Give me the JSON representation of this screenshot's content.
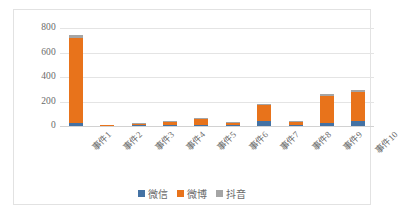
{
  "chart_data": {
    "type": "bar",
    "stacked": true,
    "title": "",
    "xlabel": "",
    "ylabel": "",
    "ylim": [
      0,
      800
    ],
    "yticks": [
      0,
      200,
      400,
      600,
      800
    ],
    "grid": true,
    "legend_position": "bottom",
    "categories": [
      "事件1",
      "事件2",
      "事件3",
      "事件4",
      "事件5",
      "事件6",
      "事件7",
      "事件8",
      "事件9",
      "事件10"
    ],
    "series": [
      {
        "name": "微信",
        "color": "#4472a4",
        "values": [
          25,
          0,
          2,
          2,
          3,
          2,
          42,
          3,
          24,
          40
        ]
      },
      {
        "name": "微博",
        "color": "#e8731b",
        "values": [
          690,
          1,
          8,
          27,
          50,
          18,
          128,
          24,
          222,
          235
        ]
      },
      {
        "name": "抖音",
        "color": "#a5a5a5",
        "values": [
          30,
          0,
          1,
          3,
          4,
          4,
          6,
          4,
          12,
          20
        ]
      }
    ],
    "totals": [
      745,
      1,
      11,
      32,
      57,
      24,
      176,
      31,
      258,
      295
    ]
  },
  "legend": {
    "items": [
      {
        "label": "微信"
      },
      {
        "label": "微博"
      },
      {
        "label": "抖音"
      }
    ]
  },
  "axis": {
    "y_tick_labels": [
      "800",
      "600",
      "400",
      "200",
      "0"
    ]
  }
}
